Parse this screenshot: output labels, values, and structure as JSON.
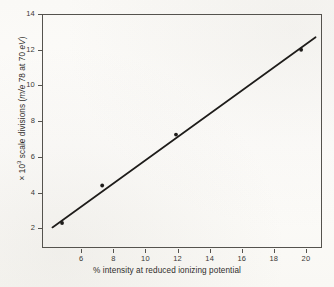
{
  "figure": {
    "background_color": "#fdfdfb",
    "ink_color": "#2b2b2b",
    "axis_color": "#55534e"
  },
  "axes": {
    "y": {
      "title_prefix": "× 10",
      "title_exponent": "3",
      "title_main": " scale divisions (",
      "title_italic_1": "m/e",
      "title_mid": " 78 at 70 ",
      "title_italic_2": "eV",
      "title_suffix": ")",
      "title_full": "× 10³ scale divisions (m/e 78 at 70 eV)",
      "ticks": [
        2,
        4,
        6,
        8,
        10,
        12,
        14
      ],
      "tick_labels": [
        "2",
        "4",
        "6",
        "8",
        "10",
        "12",
        "14"
      ],
      "min": 0.9,
      "max": 14.0
    },
    "x": {
      "title_symbol": "%",
      "title_rest": " intensity at reduced ionizing potential",
      "title_full": "% intensity at reduced ionizing potential",
      "ticks": [
        6,
        8,
        10,
        12,
        14,
        16,
        18,
        20
      ],
      "tick_labels": [
        "6",
        "8",
        "10",
        "12",
        "14",
        "16",
        "18",
        "20"
      ],
      "min": 3.55,
      "max": 21.0
    }
  },
  "chart_data": {
    "type": "scatter",
    "title": "",
    "subtitle": "",
    "xlabel": "% intensity at reduced ionizing potential",
    "ylabel": "× 10³ scale divisions (m/e 78 at 70 eV)",
    "xlim": [
      3.55,
      21.0
    ],
    "ylim": [
      0.9,
      14.0
    ],
    "xticks": [
      6,
      8,
      10,
      12,
      14,
      16,
      18,
      20
    ],
    "yticks": [
      2,
      4,
      6,
      8,
      10,
      12,
      14
    ],
    "grid": false,
    "legend": "none",
    "series": [
      {
        "name": "measured points",
        "marker": "filled-circle",
        "color": "#1e1c1a",
        "x": [
          4.8,
          7.3,
          11.9,
          19.7
        ],
        "y": [
          2.3,
          4.4,
          7.25,
          12.0
        ]
      },
      {
        "name": "least-squares fit line",
        "type": "line",
        "color": "#1e1c1a",
        "x": [
          4.2,
          20.6
        ],
        "y": [
          2.05,
          12.7
        ]
      }
    ],
    "annotations": []
  }
}
